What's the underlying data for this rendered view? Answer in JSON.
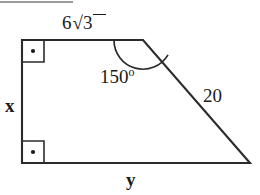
{
  "figure": {
    "shape": "right trapezoid",
    "stroke_color": "#2b2b2b",
    "text_color": "#1a1a1a",
    "background_color": "#ffffff",
    "artifact_line_color": "#9b9b9b",
    "vertices": {
      "top_left": [
        22,
        40
      ],
      "top_right": [
        143,
        40
      ],
      "bottom_right": [
        250,
        163
      ],
      "bottom_left": [
        22,
        163
      ]
    },
    "edges": [
      {
        "name": "top",
        "from": "top_left",
        "to": "top_right",
        "label": "6√3"
      },
      {
        "name": "slant",
        "from": "top_right",
        "to": "bottom_right",
        "label": "20"
      },
      {
        "name": "bottom",
        "from": "bottom_right",
        "to": "bottom_left",
        "label": "y"
      },
      {
        "name": "left",
        "from": "bottom_left",
        "to": "top_left",
        "label": "x"
      }
    ],
    "labels": {
      "top_side_coefficient": "6",
      "top_side_radical_sign": "√",
      "top_side_radicand": "3",
      "left_side": "x",
      "bottom_side": "y",
      "slant_side": "20",
      "interior_angle_value": "150",
      "interior_angle_degree_symbol": "o"
    },
    "markers": {
      "right_angle_top_left": {
        "type": "square-with-dot",
        "at": [
          22,
          40
        ],
        "size": 22
      },
      "right_angle_bottom_left": {
        "type": "square-with-dot",
        "at": [
          22,
          163
        ],
        "size": 22
      },
      "angle_arc": {
        "type": "arc",
        "vertex": [
          143,
          40
        ],
        "degrees": 150,
        "radius": 29
      }
    }
  }
}
